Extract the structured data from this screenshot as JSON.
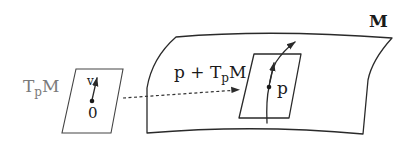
{
  "diagram": {
    "type": "tangent-space-to-manifold-illustration",
    "manifold": {
      "label": "M"
    },
    "tangent_space": {
      "label_main": "T",
      "label_sub": "p",
      "label_end": "M",
      "origin_label": "0",
      "vector_label": "v"
    },
    "affine_tangent_plane": {
      "label_prefix": "p + ",
      "label_main": "T",
      "label_sub": "p",
      "label_end": "M",
      "point_label": "p"
    },
    "colors": {
      "ink": "#2a2a2a",
      "tangent_space_label": "#7a7a7a",
      "background": "#ffffff"
    }
  }
}
